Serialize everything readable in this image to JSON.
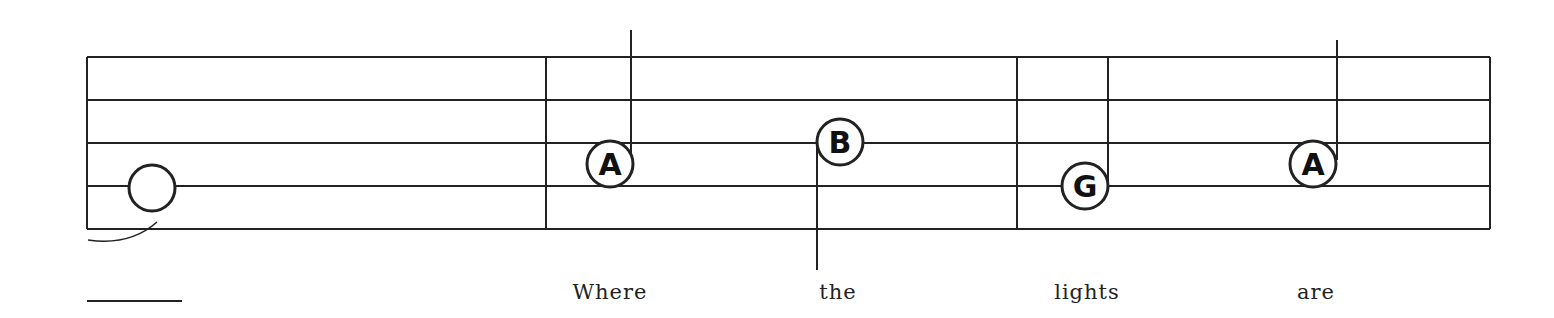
{
  "staff": {
    "line_color": "#222222",
    "lines_y": [
      57,
      100,
      143,
      186,
      229
    ],
    "x_start": 87,
    "x_end": 1490,
    "barlines_x": [
      87,
      546,
      1017,
      1490
    ]
  },
  "notes": [
    {
      "label": "",
      "type": "whole",
      "x": 152,
      "y": 188,
      "stem": "none"
    },
    {
      "label": "A",
      "x": 610,
      "y": 164,
      "stem": "up",
      "stem_x": 631,
      "stem_top": 30
    },
    {
      "label": "B",
      "x": 840,
      "y": 142,
      "stem": "down",
      "stem_x": 817,
      "stem_bottom": 270
    },
    {
      "label": "G",
      "x": 1085,
      "y": 186,
      "stem": "up",
      "stem_x": 1108,
      "stem_top": 57
    },
    {
      "label": "A",
      "x": 1313,
      "y": 164,
      "stem": "up",
      "stem_x": 1337,
      "stem_top": 40
    }
  ],
  "lyrics": [
    {
      "text": "Where",
      "x": 610
    },
    {
      "text": "the",
      "x": 838
    },
    {
      "text": "lights",
      "x": 1087
    },
    {
      "text": "are",
      "x": 1316
    }
  ],
  "lyric_extender": {
    "x1": 87,
    "x2": 182,
    "y": 301
  }
}
